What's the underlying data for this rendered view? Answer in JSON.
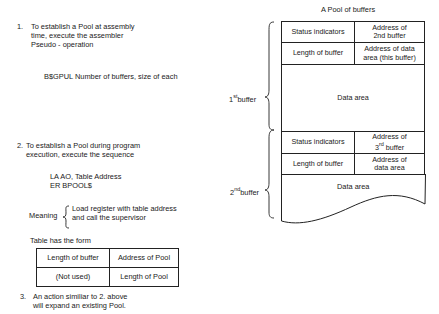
{
  "left": {
    "item1": {
      "number": "1.",
      "lines": [
        "To establish a Pool at assembly",
        "time, execute the assembler",
        "Pseudo - operation"
      ],
      "code": "B$GPUL Number of buffers, size of each"
    },
    "item2": {
      "number": "2.",
      "lines": [
        "To establish a Pool during program",
        "execution, execute the sequence"
      ],
      "code": [
        "LA AO, Table Address",
        "ER BPOOL$"
      ],
      "meaning_label": "Meaning",
      "meaning_lines": [
        "Load register with table address",
        "and call the supervisor"
      ],
      "table_caption": "Table has the form",
      "table": [
        [
          "Length of buffer",
          "Address of Pool"
        ],
        [
          "(Not used)",
          "Length of Pool"
        ]
      ]
    },
    "item3": {
      "number": "3.",
      "lines": [
        "An action similiar to 2. above",
        "will expand an existing Pool."
      ]
    }
  },
  "diagram": {
    "title": "A Pool of buffers",
    "buffer1": {
      "label_main": "1",
      "label_sup": "st",
      "label_rest": "buffer",
      "status": "Status indicators",
      "address_next": [
        "Address of",
        "2nd buffer"
      ],
      "length": "Length of buffer",
      "address_data": [
        "Address of data",
        "area (this buffer)"
      ],
      "data": "Data area"
    },
    "buffer2": {
      "label_main": "2",
      "label_sup": "nd",
      "label_rest": "buffer",
      "status": "Status indicators",
      "address_next_a": "Address of",
      "address_next_b_main": "3",
      "address_next_b_sup": "rd",
      "address_next_b_rest": " buffer",
      "length": "Length of buffer",
      "address_data": [
        "Address of",
        "data area"
      ],
      "data": "Data area"
    }
  }
}
